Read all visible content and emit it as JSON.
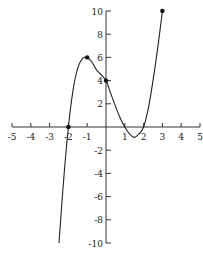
{
  "chart_data": {
    "type": "line",
    "title": "",
    "xlabel": "",
    "ylabel": "",
    "xlim": [
      -5,
      5
    ],
    "ylim": [
      -10,
      10
    ],
    "grid": false,
    "x_ticks": [
      -5,
      -4,
      -3,
      -2,
      -1,
      1,
      2,
      3,
      4,
      5
    ],
    "x_tick_labels": [
      "-5",
      "-4",
      "-3",
      "-2",
      "-1",
      "1",
      "2",
      "3",
      "4",
      "5"
    ],
    "y_ticks": [
      10,
      8,
      6,
      4,
      2,
      -2,
      -4,
      -6,
      -8,
      -10
    ],
    "y_tick_labels": [
      "10",
      "8",
      "6",
      "4",
      "2",
      "-2",
      "-4",
      "-6",
      "-8",
      "-10"
    ],
    "series": [
      {
        "name": "f(x)",
        "x": [
          -2.5,
          -2.25,
          -2,
          -1.75,
          -1.5,
          -1.25,
          -1,
          -0.75,
          -0.5,
          -0.25,
          0,
          0.25,
          0.5,
          0.75,
          1,
          1.25,
          1.5,
          1.75,
          2,
          2.25,
          2.5,
          2.75,
          3
        ],
        "y": [
          -10,
          -4.5,
          0,
          3.2,
          5.1,
          5.9,
          6,
          5.6,
          4.9,
          4.5,
          4,
          2.9,
          1.8,
          0.8,
          0,
          -0.6,
          -0.9,
          -0.6,
          0,
          1.6,
          4,
          6.8,
          10
        ]
      }
    ],
    "marked_points": [
      {
        "x": -2,
        "y": 0
      },
      {
        "x": -1,
        "y": 6
      },
      {
        "x": 0,
        "y": 4
      },
      {
        "x": 3,
        "y": 10
      }
    ]
  }
}
